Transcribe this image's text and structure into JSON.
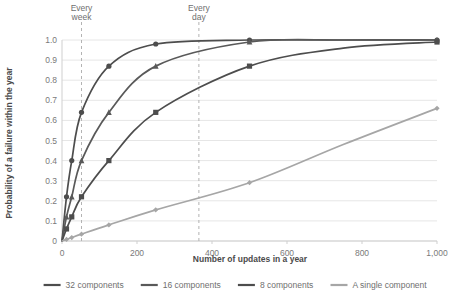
{
  "chart_data": {
    "type": "line",
    "title": "",
    "xlabel": "Number of updates in a year",
    "ylabel": "Probability of a failure within the year",
    "xlim": [
      0,
      1000
    ],
    "ylim": [
      0,
      1.0
    ],
    "grid": true,
    "legend_position": "bottom",
    "xticks": [
      0,
      200,
      400,
      600,
      800,
      1000
    ],
    "xtick_labels": [
      "0",
      "200",
      "400",
      "600",
      "800",
      "1,000"
    ],
    "yticks": [
      0,
      0.1,
      0.2,
      0.3,
      0.4,
      0.5,
      0.6,
      0.7,
      0.8,
      0.9,
      1.0
    ],
    "ytick_labels": [
      "0",
      "0.1",
      "0.2",
      "0.3",
      "0.4",
      "0.5",
      "0.6",
      "0.7",
      "0.8",
      "0.9",
      "1.0"
    ],
    "annotations": [
      {
        "label_line1": "Every",
        "label_line2": "week",
        "x": 52,
        "style": "dashed-vertical"
      },
      {
        "label_line1": "Every",
        "label_line2": "day",
        "x": 365,
        "style": "dashed-vertical"
      }
    ],
    "x": [
      0,
      12,
      26,
      52,
      125,
      250,
      500,
      750,
      1000
    ],
    "series": [
      {
        "name": "32 components",
        "color": "#4d4d4d",
        "marker": "circle",
        "values": [
          0.0,
          0.22,
          0.4,
          0.64,
          0.87,
          0.98,
          1.0,
          1.0,
          1.0
        ]
      },
      {
        "name": "16 components",
        "color": "#595959",
        "marker": "triangle",
        "values": [
          0.0,
          0.12,
          0.22,
          0.4,
          0.64,
          0.87,
          0.99,
          1.0,
          1.0
        ]
      },
      {
        "name": "8 components",
        "color": "#4d4d4d",
        "marker": "square",
        "values": [
          0.0,
          0.06,
          0.12,
          0.22,
          0.4,
          0.64,
          0.87,
          0.96,
          0.99
        ]
      },
      {
        "name": "A single component",
        "color": "#a6a6a6",
        "marker": "diamond",
        "values": [
          0.0,
          0.008,
          0.017,
          0.034,
          0.08,
          0.155,
          0.29,
          0.48,
          0.66
        ]
      }
    ]
  },
  "legend": {
    "items": [
      {
        "label": "32 components",
        "color": "#4d4d4d"
      },
      {
        "label": "16 components",
        "color": "#595959"
      },
      {
        "label": "8 components",
        "color": "#4d4d4d"
      },
      {
        "label": "A single component",
        "color": "#a6a6a6"
      }
    ]
  },
  "axes": {
    "x_title": "Number of updates in a year",
    "y_title": "Probability of a failure within the year"
  },
  "colors": {
    "grid": "#e6e6e6",
    "axis": "#cfcfcf",
    "annotation_line": "#b3b3b3",
    "text": "#6f6f6f"
  }
}
